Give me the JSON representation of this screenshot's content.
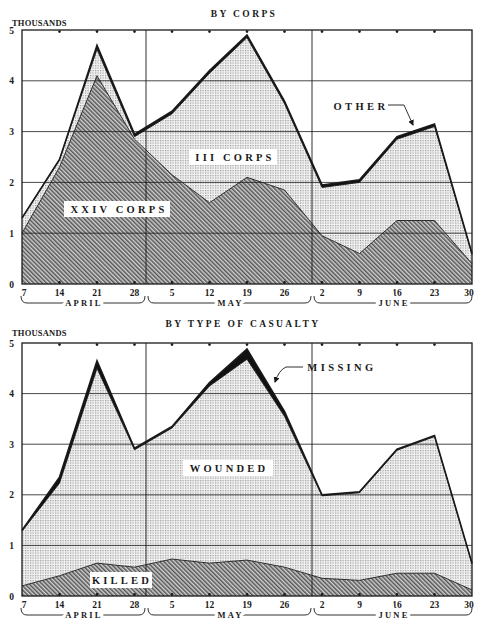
{
  "chart_data": [
    {
      "type": "area",
      "stacked": true,
      "title": "BY CORPS",
      "ylabel": "THOUSANDS",
      "xlabel": "",
      "ylim": [
        0,
        5
      ],
      "yticks": [
        "0",
        "1",
        "2",
        "3",
        "4",
        "5"
      ],
      "grid": true,
      "categories": [
        "7",
        "14",
        "21",
        "28",
        "5",
        "12",
        "19",
        "26",
        "2",
        "9",
        "16",
        "23",
        "30"
      ],
      "months": [
        {
          "label": "APRIL",
          "start": 0,
          "end": 3
        },
        {
          "label": "MAY",
          "start": 4,
          "end": 7
        },
        {
          "label": "JUNE",
          "start": 8,
          "end": 12
        }
      ],
      "series": [
        {
          "name": "XXIV CORPS",
          "pattern": "hatch",
          "values": [
            1.0,
            2.3,
            4.1,
            2.85,
            2.15,
            1.6,
            2.1,
            1.85,
            0.95,
            0.6,
            1.25,
            1.25,
            0.4
          ]
        },
        {
          "name": "III CORPS",
          "pattern": "stipple",
          "values": [
            0.3,
            0.15,
            0.52,
            0.05,
            1.2,
            2.55,
            2.75,
            1.7,
            0.95,
            1.4,
            1.6,
            1.85,
            0.18
          ]
        },
        {
          "name": "OTHER",
          "pattern": "solid",
          "values": [
            0,
            0,
            0.08,
            0.05,
            0.05,
            0.05,
            0.05,
            0.05,
            0.05,
            0.05,
            0.05,
            0.05,
            0.02
          ]
        }
      ],
      "totals": [
        1.3,
        2.45,
        4.7,
        2.95,
        3.4,
        4.2,
        4.9,
        3.6,
        1.95,
        2.05,
        2.9,
        3.15,
        0.6
      ]
    },
    {
      "type": "area",
      "stacked": true,
      "title": "BY TYPE OF CASUALTY",
      "ylabel": "THOUSANDS",
      "xlabel": "",
      "ylim": [
        0,
        5
      ],
      "yticks": [
        "0",
        "1",
        "2",
        "3",
        "4",
        "5"
      ],
      "grid": true,
      "categories": [
        "7",
        "14",
        "21",
        "28",
        "5",
        "12",
        "19",
        "26",
        "2",
        "9",
        "16",
        "23",
        "30"
      ],
      "months": [
        {
          "label": "APRIL",
          "start": 0,
          "end": 3
        },
        {
          "label": "MAY",
          "start": 4,
          "end": 7
        },
        {
          "label": "JUNE",
          "start": 8,
          "end": 12
        }
      ],
      "series": [
        {
          "name": "KILLED",
          "pattern": "hatch",
          "values": [
            0.2,
            0.4,
            0.65,
            0.57,
            0.73,
            0.65,
            0.71,
            0.57,
            0.35,
            0.31,
            0.45,
            0.45,
            0.12
          ]
        },
        {
          "name": "WOUNDED",
          "pattern": "stipple",
          "values": [
            1.08,
            1.83,
            3.85,
            2.32,
            2.59,
            3.5,
            3.97,
            2.98,
            1.63,
            1.73,
            2.43,
            2.7,
            0.51
          ]
        },
        {
          "name": "MISSING",
          "pattern": "solid",
          "values": [
            0.02,
            0.12,
            0.15,
            0.03,
            0.03,
            0.07,
            0.2,
            0.1,
            0.02,
            0.02,
            0.02,
            0.02,
            0.02
          ]
        }
      ],
      "totals": [
        1.3,
        2.35,
        4.65,
        2.92,
        3.35,
        4.22,
        4.88,
        3.65,
        2.0,
        2.06,
        2.9,
        3.17,
        0.65
      ]
    }
  ],
  "colors": {
    "ink": "#1a1a1a",
    "hatch_line": "#555555",
    "hatch_bg": "#d0d0d0",
    "stipple_dot": "#9a9a9a",
    "stipple_bg": "#f2f2f2",
    "band": "#111111"
  }
}
